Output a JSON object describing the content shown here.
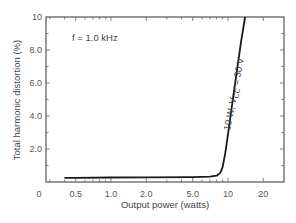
{
  "chart_data": {
    "type": "line",
    "title": "",
    "xlabel": "Output power (watts)",
    "ylabel": "Total harmonic distortion (%)",
    "xscale": "log",
    "xlim": [
      0.25,
      28
    ],
    "ylim": [
      0,
      10
    ],
    "x_tick_labels": [
      "0",
      "0.5",
      "1.0",
      "2.0",
      "5.0",
      "10",
      "20"
    ],
    "x_ticks": [
      0.5,
      1.0,
      2.0,
      5.0,
      10,
      20
    ],
    "y_tick_labels": [
      "2.0",
      "4.0",
      "6.0",
      "8.0",
      "10"
    ],
    "y_ticks": [
      2,
      4,
      6,
      8,
      10
    ],
    "grid": false,
    "legend": null,
    "annotations": [
      {
        "text": "f = 1.0 kHz",
        "position": "upper-left"
      },
      {
        "text_main": "10 W, V",
        "text_sub": "CC",
        "text_tail": " = 30 V",
        "position": "along-curve"
      }
    ],
    "series": [
      {
        "name": "10 W, VCC = 30 V",
        "x": [
          0.4,
          0.5,
          1.0,
          2.0,
          5.0,
          7.0,
          8.0,
          8.6,
          9.0,
          9.5,
          10.0,
          11.0,
          12.0,
          13.0,
          14.0
        ],
        "y": [
          0.25,
          0.25,
          0.27,
          0.28,
          0.3,
          0.32,
          0.38,
          0.55,
          0.9,
          1.8,
          2.9,
          5.0,
          6.9,
          8.6,
          10.0
        ]
      }
    ]
  },
  "labels": {
    "ylabel": "Total harmonic distortion (%)",
    "xlabel": "Output power (watts)",
    "freq": "f = 1.0 kHz",
    "zero": "0"
  }
}
